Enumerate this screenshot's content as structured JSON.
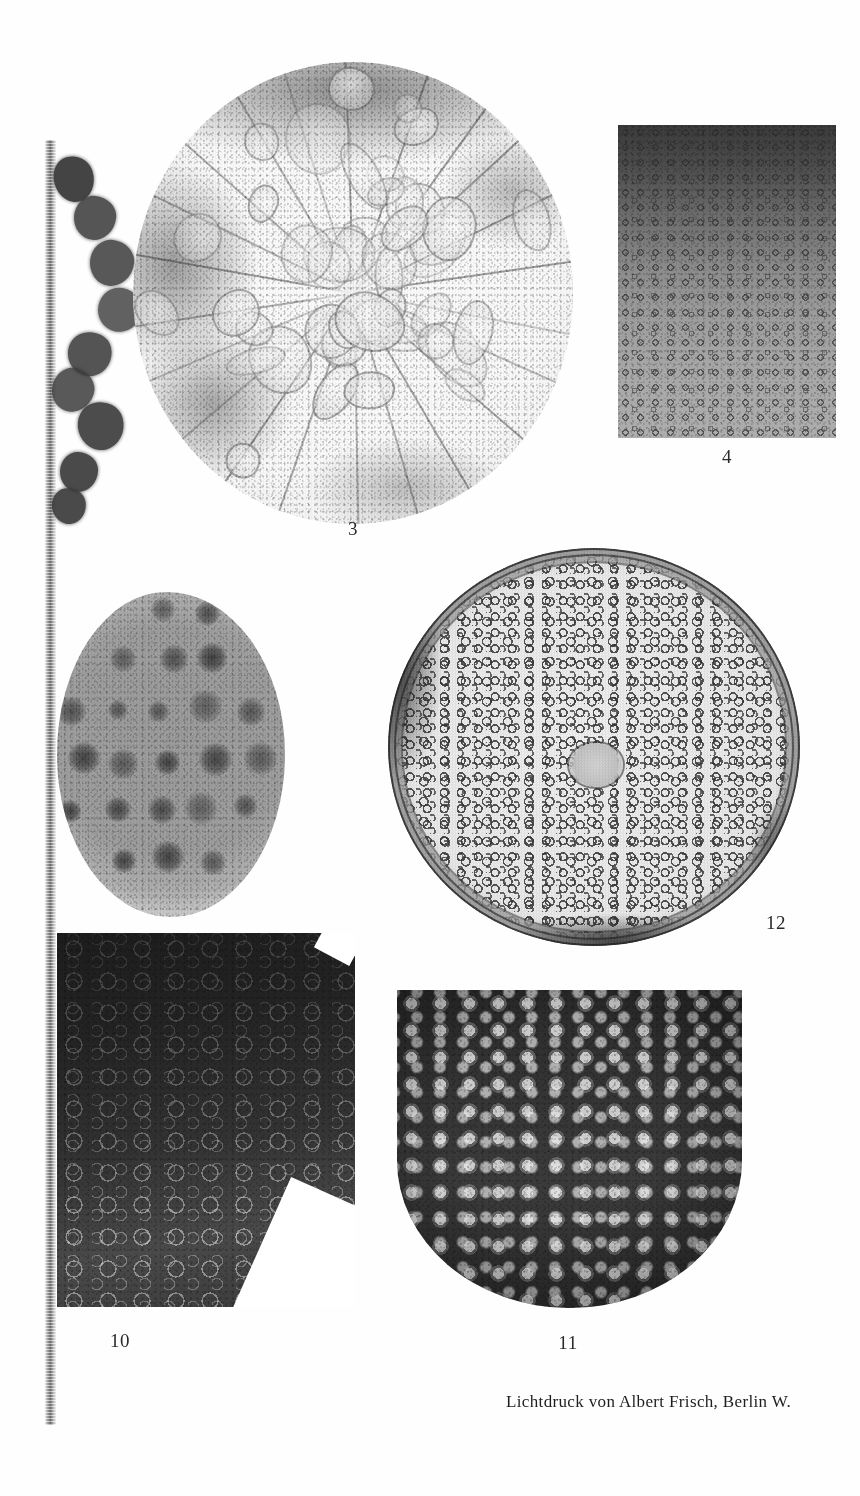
{
  "plate": {
    "background_color": "#fefefe",
    "width": 860,
    "height": 1496,
    "printer_credit": "Lichtdruck von Albert Frisch, Berlin W."
  },
  "figures": [
    {
      "number": "",
      "name": "partial-left-figure",
      "description": "partial figure cropped at left page edge, column of dark rounded blobs beside a vertical plate edge",
      "kind": "photomicrograph"
    },
    {
      "number": "3",
      "name": "figure-3",
      "description": "circular section showing radial polygonal cell chambers",
      "kind": "photomicrograph"
    },
    {
      "number": "4",
      "name": "figure-4",
      "description": "rectangular field of small ring-shaped cells, dark at top shading lighter toward bottom",
      "kind": "photomicrograph"
    },
    {
      "number": "10",
      "name": "figure-10",
      "description": "dark rectangular field with bright branching reticulate lines",
      "kind": "photomicrograph"
    },
    {
      "number": "11",
      "name": "figure-11",
      "description": "dark rounded-bottom section with bright clustered blotches",
      "kind": "photomicrograph"
    },
    {
      "number": "12",
      "name": "figure-12",
      "description": "large circular section with concentric rim rings and labyrinthine interior pattern",
      "kind": "photomicrograph"
    }
  ],
  "captions": {
    "fig3": "3",
    "fig4": "4",
    "fig10": "10",
    "fig11": "11",
    "fig12": "12"
  },
  "colors": {
    "ink": "#1e1e1e",
    "paper": "#fefefe",
    "midtone": "#8b8b8b",
    "shadow": "#2b2b2b"
  }
}
